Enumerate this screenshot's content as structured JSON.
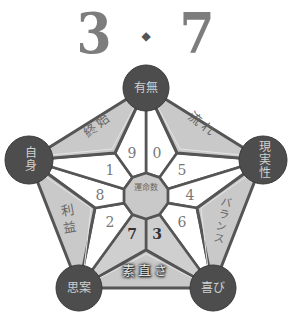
{
  "title": {
    "left": "3",
    "separator": "◆",
    "right": "7"
  },
  "center": {
    "label": "運命数"
  },
  "nodes": {
    "top": "有無",
    "left": "自身",
    "right": "現実性",
    "bottom_left": "思案",
    "bottom_right": "喜び"
  },
  "petals": {
    "top_left": "終始",
    "top_right": "流れ",
    "left_bottom": "利益",
    "right_bottom": "バランス",
    "bottom": "素直さ"
  },
  "segments": {
    "s9": "9",
    "s0": "0",
    "s5": "5",
    "s4": "4",
    "s6": "6",
    "s3": "3",
    "s7": "7",
    "s2": "2",
    "s8": "8",
    "s1": "1"
  },
  "highlighted_numbers": [
    "3",
    "7"
  ],
  "colors": {
    "node_fill": "#4d4d4d",
    "petal_fill": "#c9c9c9",
    "line": "#555555",
    "title": "#7d7d7d"
  }
}
